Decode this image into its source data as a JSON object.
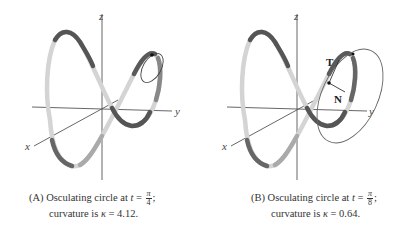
{
  "figure": {
    "panels": [
      {
        "id": "A",
        "axes": {
          "x": "x",
          "y": "y",
          "z": "z"
        },
        "caption": {
          "prefix": "(A) Osculating circle at ",
          "t_var": "t",
          "equals": " = ",
          "numerator": "π",
          "denominator": "4",
          "suffix": ";",
          "line2_prefix": "curvature is ",
          "kappa": "κ",
          "kappa_eq": " = 4.12."
        },
        "curvature": 4.12,
        "t": "π/4"
      },
      {
        "id": "B",
        "axes": {
          "x": "x",
          "y": "y",
          "z": "z"
        },
        "vectors": {
          "tangent": "T",
          "normal": "N"
        },
        "caption": {
          "prefix": "(B) Osculating circle at ",
          "t_var": "t",
          "equals": " = ",
          "numerator": "π",
          "denominator": "8",
          "suffix": ";",
          "line2_prefix": "curvature is ",
          "kappa": "κ",
          "kappa_eq": " = 0.64."
        },
        "curvature": 0.64,
        "t": "π/8"
      }
    ],
    "colors": {
      "axis": "#555555",
      "curve_dark": "#4a4a4a",
      "curve_light": "#d8d8d8",
      "circle": "#666666"
    }
  }
}
